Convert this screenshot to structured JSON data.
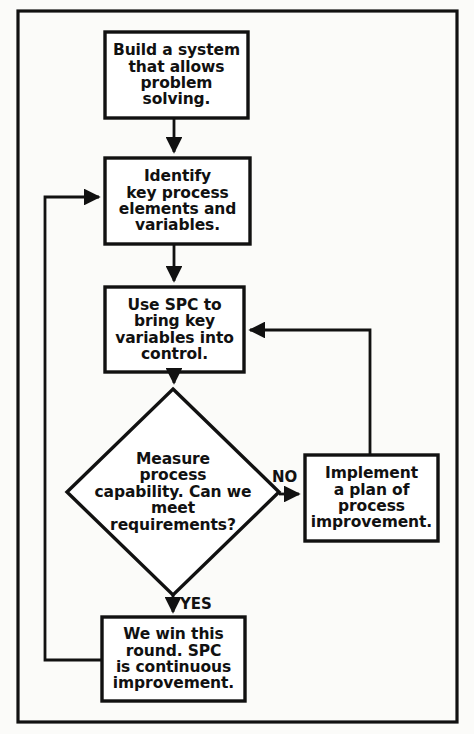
{
  "diagram": {
    "type": "flowchart",
    "border_color": "#111111",
    "background_color": "#fbfbf9",
    "line_color": "#111111",
    "nodes": [
      {
        "id": "build-system",
        "shape": "rectangle",
        "text": "Build a system\nthat allows\nproblem\nsolving.",
        "x": 105,
        "y": 32,
        "w": 143,
        "h": 86
      },
      {
        "id": "identify-elements",
        "shape": "rectangle",
        "text": "Identify\nkey process\nelements and\nvariables.",
        "x": 105,
        "y": 158,
        "w": 145,
        "h": 86
      },
      {
        "id": "use-spc",
        "shape": "rectangle",
        "text": "Use SPC to\nbring key\nvariables into\ncontrol.",
        "x": 105,
        "y": 287,
        "w": 139,
        "h": 85
      },
      {
        "id": "measure-capability",
        "shape": "diamond",
        "text": "Measure\nprocess\ncapability. Can we\nmeet\nrequirements?",
        "cx": 173,
        "cy": 492,
        "rx": 106,
        "ry": 103
      },
      {
        "id": "implement-plan",
        "shape": "rectangle",
        "text": "Implement\na plan of\nprocess\nimprovement.",
        "x": 305,
        "y": 455,
        "w": 133,
        "h": 86
      },
      {
        "id": "we-win",
        "shape": "rectangle",
        "text": "We win this\nround. SPC\nis continuous\nimprovement.",
        "x": 102,
        "y": 617,
        "w": 143,
        "h": 84
      }
    ],
    "edges": [
      {
        "id": "build-to-identify",
        "from": "build-system",
        "to": "identify-elements",
        "label": ""
      },
      {
        "id": "identify-to-spc",
        "from": "identify-elements",
        "to": "use-spc",
        "label": ""
      },
      {
        "id": "spc-to-measure",
        "from": "use-spc",
        "to": "measure-capability",
        "label": ""
      },
      {
        "id": "measure-no-to-implement",
        "from": "measure-capability",
        "to": "implement-plan",
        "label": "NO"
      },
      {
        "id": "implement-back-to-spc",
        "from": "implement-plan",
        "to": "use-spc",
        "label": ""
      },
      {
        "id": "measure-yes-to-we-win",
        "from": "measure-capability",
        "to": "we-win",
        "label": "YES"
      },
      {
        "id": "we-win-back-to-identify",
        "from": "we-win",
        "to": "identify-elements",
        "label": ""
      }
    ],
    "edge_labels": {
      "no": "NO",
      "yes": "YES"
    }
  }
}
